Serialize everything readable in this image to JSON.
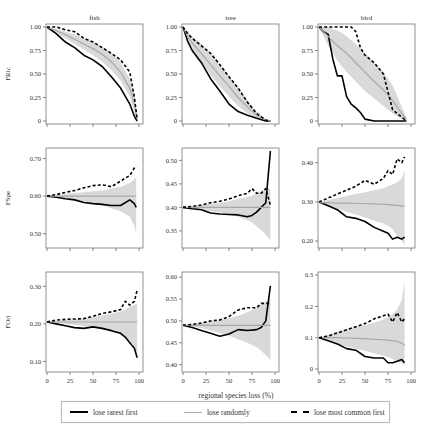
{
  "chart_data": [
    {
      "type": "line",
      "panel": "fish-FRic",
      "column_title": "fish",
      "ylabel": "FRic",
      "xlim": [
        0,
        100
      ],
      "ylim": [
        0,
        1.0
      ],
      "yticks": [
        0,
        0.25,
        0.5,
        0.75,
        1.0
      ],
      "ytick_labels": [
        "0",
        "0.25",
        "0.50",
        "0.75",
        "1.00"
      ],
      "x": [
        0,
        10,
        20,
        30,
        40,
        50,
        60,
        70,
        80,
        90,
        95,
        98
      ],
      "series": [
        {
          "name": "lose rarest first",
          "values": [
            1.0,
            0.93,
            0.84,
            0.78,
            0.7,
            0.65,
            0.58,
            0.47,
            0.35,
            0.18,
            0.05,
            0.0
          ]
        },
        {
          "name": "lose randomly",
          "values": [
            1.0,
            0.96,
            0.92,
            0.87,
            0.82,
            0.77,
            0.71,
            0.63,
            0.52,
            0.35,
            0.18,
            0.02
          ]
        },
        {
          "name": "lose most common first",
          "values": [
            1.0,
            1.0,
            0.97,
            0.95,
            0.88,
            0.84,
            0.78,
            0.72,
            0.65,
            0.52,
            0.25,
            0.02
          ]
        }
      ],
      "band_upper": [
        1.0,
        0.98,
        0.95,
        0.92,
        0.88,
        0.84,
        0.79,
        0.72,
        0.62,
        0.45,
        0.28,
        0.04
      ],
      "band_lower": [
        1.0,
        0.94,
        0.88,
        0.82,
        0.76,
        0.7,
        0.63,
        0.54,
        0.43,
        0.26,
        0.1,
        0.0
      ]
    },
    {
      "type": "line",
      "panel": "tree-FRic",
      "column_title": "tree",
      "ylabel": "",
      "xlim": [
        0,
        100
      ],
      "ylim": [
        0,
        1.0
      ],
      "yticks": [
        0,
        0.25,
        0.5,
        0.75,
        1.0
      ],
      "ytick_labels": [
        "0",
        "0.25",
        "0.50",
        "0.75",
        "1.00"
      ],
      "x": [
        0,
        5,
        10,
        20,
        30,
        40,
        50,
        60,
        70,
        80,
        90,
        95
      ],
      "series": [
        {
          "name": "lose rarest first",
          "values": [
            1.0,
            0.85,
            0.75,
            0.62,
            0.45,
            0.32,
            0.18,
            0.1,
            0.06,
            0.03,
            0.0,
            0.0
          ]
        },
        {
          "name": "lose randomly",
          "values": [
            1.0,
            0.9,
            0.83,
            0.72,
            0.6,
            0.48,
            0.37,
            0.25,
            0.15,
            0.06,
            0.01,
            0.0
          ]
        },
        {
          "name": "lose most common first",
          "values": [
            1.0,
            0.93,
            0.88,
            0.8,
            0.72,
            0.6,
            0.47,
            0.35,
            0.2,
            0.08,
            0.01,
            0.0
          ]
        }
      ],
      "band_upper": [
        1.0,
        0.95,
        0.9,
        0.82,
        0.72,
        0.6,
        0.48,
        0.35,
        0.22,
        0.1,
        0.02,
        0.0
      ],
      "band_lower": [
        1.0,
        0.85,
        0.76,
        0.63,
        0.49,
        0.37,
        0.26,
        0.16,
        0.08,
        0.02,
        0.0,
        0.0
      ]
    },
    {
      "type": "line",
      "panel": "bird-FRic",
      "column_title": "bird",
      "ylabel": "",
      "xlim": [
        0,
        100
      ],
      "ylim": [
        0,
        1.0
      ],
      "yticks": [
        0,
        0.25,
        0.5,
        0.75,
        1.0
      ],
      "ytick_labels": [
        "0",
        "0.25",
        "0.50",
        "0.75",
        "1.00"
      ],
      "x": [
        0,
        5,
        10,
        15,
        20,
        25,
        30,
        35,
        40,
        45,
        50,
        60,
        70,
        80,
        90,
        95
      ],
      "series": [
        {
          "name": "lose rarest first",
          "values": [
            1.0,
            0.95,
            0.92,
            0.66,
            0.48,
            0.48,
            0.26,
            0.18,
            0.14,
            0.09,
            0.02,
            0.0,
            0.0,
            0.0,
            0.0,
            0.0
          ]
        },
        {
          "name": "lose randomly",
          "values": [
            1.0,
            0.95,
            0.9,
            0.85,
            0.8,
            0.76,
            0.72,
            0.67,
            0.62,
            0.57,
            0.52,
            0.42,
            0.33,
            0.22,
            0.08,
            0.02
          ]
        },
        {
          "name": "lose most common first",
          "values": [
            1.0,
            1.0,
            1.0,
            1.0,
            1.0,
            1.0,
            1.0,
            1.0,
            0.95,
            0.78,
            0.7,
            0.62,
            0.5,
            0.12,
            0.04,
            0.0
          ]
        }
      ],
      "band_upper": [
        1.0,
        1.0,
        1.0,
        0.98,
        0.96,
        0.94,
        0.9,
        0.86,
        0.82,
        0.77,
        0.72,
        0.62,
        0.52,
        0.38,
        0.15,
        0.04
      ],
      "band_lower": [
        1.0,
        0.9,
        0.8,
        0.72,
        0.64,
        0.58,
        0.52,
        0.47,
        0.42,
        0.37,
        0.32,
        0.24,
        0.16,
        0.08,
        0.02,
        0.0
      ]
    },
    {
      "type": "line",
      "panel": "fish-FSpe",
      "ylabel": "FSpe",
      "xlim": [
        0,
        100
      ],
      "ylim": [
        0.47,
        0.72
      ],
      "yticks": [
        0.5,
        0.6,
        0.7
      ],
      "ytick_labels": [
        "0.50",
        "0.60",
        "0.70"
      ],
      "x": [
        0,
        10,
        20,
        30,
        40,
        50,
        60,
        70,
        80,
        90,
        95,
        97
      ],
      "series": [
        {
          "name": "lose rarest first",
          "values": [
            0.6,
            0.597,
            0.593,
            0.59,
            0.583,
            0.58,
            0.578,
            0.575,
            0.575,
            0.59,
            0.58,
            0.57
          ]
        },
        {
          "name": "lose randomly",
          "values": [
            0.6,
            0.6,
            0.6,
            0.6,
            0.6,
            0.6,
            0.6,
            0.6,
            0.6,
            0.6,
            0.6,
            0.6
          ]
        },
        {
          "name": "lose most common first",
          "values": [
            0.6,
            0.604,
            0.61,
            0.615,
            0.622,
            0.628,
            0.63,
            0.625,
            0.64,
            0.655,
            0.675,
            0.68
          ]
        }
      ],
      "band_upper": [
        0.6,
        0.602,
        0.605,
        0.608,
        0.61,
        0.613,
        0.615,
        0.62,
        0.625,
        0.635,
        0.645,
        0.65
      ],
      "band_lower": [
        0.6,
        0.598,
        0.595,
        0.59,
        0.586,
        0.58,
        0.575,
        0.568,
        0.56,
        0.545,
        0.52,
        0.5
      ]
    },
    {
      "type": "line",
      "panel": "tree-FSpe",
      "ylabel": "",
      "xlim": [
        0,
        100
      ],
      "ylim": [
        0.32,
        0.52
      ],
      "yticks": [
        0.35,
        0.4,
        0.45,
        0.5
      ],
      "ytick_labels": [
        "0.35",
        "0.40",
        "0.45",
        "0.50"
      ],
      "x": [
        0,
        10,
        20,
        30,
        40,
        50,
        60,
        70,
        75,
        80,
        85,
        90,
        95
      ],
      "series": [
        {
          "name": "lose rarest first",
          "values": [
            0.4,
            0.397,
            0.395,
            0.388,
            0.386,
            0.385,
            0.384,
            0.38,
            0.383,
            0.39,
            0.4,
            0.41,
            0.52
          ]
        },
        {
          "name": "lose randomly",
          "values": [
            0.4,
            0.4,
            0.4,
            0.4,
            0.4,
            0.4,
            0.4,
            0.4,
            0.4,
            0.4,
            0.4,
            0.4,
            0.4
          ]
        },
        {
          "name": "lose most common first",
          "values": [
            0.4,
            0.402,
            0.405,
            0.41,
            0.413,
            0.418,
            0.425,
            0.43,
            0.44,
            0.43,
            0.43,
            0.44,
            0.405
          ]
        }
      ],
      "band_upper": [
        0.4,
        0.402,
        0.405,
        0.408,
        0.41,
        0.413,
        0.418,
        0.422,
        0.425,
        0.43,
        0.435,
        0.44,
        0.44
      ],
      "band_lower": [
        0.4,
        0.398,
        0.395,
        0.392,
        0.389,
        0.385,
        0.38,
        0.373,
        0.368,
        0.36,
        0.352,
        0.342,
        0.33
      ]
    },
    {
      "type": "line",
      "panel": "bird-FSpe",
      "ylabel": "",
      "xlim": [
        0,
        100
      ],
      "ylim": [
        0.19,
        0.43
      ],
      "yticks": [
        0.2,
        0.3,
        0.4
      ],
      "ytick_labels": [
        "0.20",
        "0.30",
        "0.40"
      ],
      "x": [
        0,
        10,
        20,
        30,
        40,
        50,
        60,
        70,
        75,
        80,
        85,
        90,
        93
      ],
      "series": [
        {
          "name": "lose rarest first",
          "values": [
            0.3,
            0.29,
            0.28,
            0.262,
            0.258,
            0.25,
            0.235,
            0.225,
            0.22,
            0.205,
            0.21,
            0.205,
            0.21
          ]
        },
        {
          "name": "lose randomly",
          "values": [
            0.298,
            0.298,
            0.297,
            0.297,
            0.296,
            0.296,
            0.295,
            0.294,
            0.293,
            0.292,
            0.291,
            0.29,
            0.29
          ]
        },
        {
          "name": "lose most common first",
          "values": [
            0.3,
            0.31,
            0.32,
            0.33,
            0.34,
            0.355,
            0.345,
            0.36,
            0.38,
            0.37,
            0.41,
            0.4,
            0.415
          ]
        }
      ],
      "band_upper": [
        0.3,
        0.305,
        0.31,
        0.315,
        0.32,
        0.325,
        0.33,
        0.335,
        0.34,
        0.345,
        0.35,
        0.36,
        0.38
      ],
      "band_lower": [
        0.3,
        0.29,
        0.283,
        0.275,
        0.268,
        0.26,
        0.252,
        0.245,
        0.24,
        0.23,
        0.215,
        0.2,
        0.19
      ]
    },
    {
      "type": "line",
      "panel": "fish-FOri",
      "ylabel": "FOri",
      "xlim": [
        0,
        100
      ],
      "ylim": [
        0.08,
        0.33
      ],
      "yticks": [
        0.1,
        0.2,
        0.3
      ],
      "ytick_labels": [
        "0.10",
        "0.20",
        "0.30"
      ],
      "xticks": [
        0,
        25,
        50,
        75,
        100
      ],
      "xtick_labels": [
        "0",
        "25",
        "50",
        "75",
        "100"
      ],
      "x": [
        0,
        10,
        20,
        30,
        40,
        50,
        60,
        70,
        80,
        85,
        90,
        95,
        98
      ],
      "series": [
        {
          "name": "lose rarest first",
          "values": [
            0.205,
            0.2,
            0.195,
            0.19,
            0.188,
            0.192,
            0.188,
            0.182,
            0.175,
            0.165,
            0.15,
            0.135,
            0.11
          ]
        },
        {
          "name": "lose randomly",
          "values": [
            0.205,
            0.205,
            0.205,
            0.205,
            0.205,
            0.205,
            0.205,
            0.205,
            0.205,
            0.205,
            0.205,
            0.205,
            0.205
          ]
        },
        {
          "name": "lose most common first",
          "values": [
            0.205,
            0.21,
            0.212,
            0.213,
            0.214,
            0.22,
            0.228,
            0.232,
            0.238,
            0.26,
            0.25,
            0.26,
            0.29
          ]
        }
      ],
      "band_upper": [
        0.205,
        0.207,
        0.21,
        0.212,
        0.215,
        0.218,
        0.222,
        0.227,
        0.233,
        0.238,
        0.245,
        0.25,
        0.255
      ],
      "band_lower": [
        0.205,
        0.203,
        0.2,
        0.197,
        0.194,
        0.19,
        0.186,
        0.18,
        0.172,
        0.165,
        0.155,
        0.14,
        0.12
      ]
    },
    {
      "type": "line",
      "panel": "tree-FOri",
      "ylabel": "",
      "xlim": [
        0,
        100
      ],
      "ylim": [
        0.39,
        0.605
      ],
      "yticks": [
        0.4,
        0.45,
        0.5,
        0.55,
        0.6
      ],
      "ytick_labels": [
        "0.40",
        "0.45",
        "0.50",
        "0.55",
        "0.60"
      ],
      "xticks": [
        0,
        25,
        50,
        75,
        100
      ],
      "xtick_labels": [
        "0",
        "25",
        "50",
        "75",
        "100"
      ],
      "xlabel": "regional species loss (%)",
      "x": [
        0,
        10,
        20,
        30,
        40,
        50,
        60,
        70,
        80,
        85,
        90,
        95
      ],
      "series": [
        {
          "name": "lose rarest first",
          "values": [
            0.49,
            0.485,
            0.478,
            0.472,
            0.465,
            0.47,
            0.48,
            0.478,
            0.48,
            0.485,
            0.5,
            0.58
          ]
        },
        {
          "name": "lose randomly",
          "values": [
            0.49,
            0.49,
            0.49,
            0.49,
            0.49,
            0.49,
            0.49,
            0.49,
            0.49,
            0.49,
            0.49,
            0.49
          ]
        },
        {
          "name": "lose most common first",
          "values": [
            0.49,
            0.492,
            0.495,
            0.5,
            0.502,
            0.51,
            0.525,
            0.53,
            0.53,
            0.54,
            0.54,
            0.54
          ]
        }
      ],
      "band_upper": [
        0.49,
        0.492,
        0.495,
        0.498,
        0.502,
        0.506,
        0.512,
        0.52,
        0.53,
        0.538,
        0.545,
        0.55
      ],
      "band_lower": [
        0.49,
        0.487,
        0.483,
        0.478,
        0.472,
        0.466,
        0.458,
        0.45,
        0.44,
        0.432,
        0.422,
        0.41
      ]
    },
    {
      "type": "line",
      "panel": "bird-FOri",
      "ylabel": "",
      "xlim": [
        0,
        100
      ],
      "ylim": [
        0,
        0.3
      ],
      "yticks": [
        0,
        0.1,
        0.2,
        0.3
      ],
      "ytick_labels": [
        "0",
        "0.1",
        "0.2",
        "0.3"
      ],
      "xticks": [
        0,
        25,
        50,
        75,
        100
      ],
      "xtick_labels": [
        "0",
        "25",
        "50",
        "75",
        "100"
      ],
      "x": [
        0,
        10,
        20,
        30,
        40,
        50,
        60,
        70,
        75,
        80,
        85,
        90,
        93
      ],
      "series": [
        {
          "name": "lose rarest first",
          "values": [
            0.1,
            0.09,
            0.08,
            0.065,
            0.06,
            0.04,
            0.035,
            0.035,
            0.02,
            0.02,
            0.025,
            0.03,
            0.02
          ]
        },
        {
          "name": "lose randomly",
          "values": [
            0.1,
            0.1,
            0.1,
            0.099,
            0.098,
            0.097,
            0.095,
            0.093,
            0.092,
            0.09,
            0.088,
            0.082,
            0.075
          ]
        },
        {
          "name": "lose most common first",
          "values": [
            0.1,
            0.105,
            0.115,
            0.125,
            0.135,
            0.145,
            0.16,
            0.17,
            0.175,
            0.15,
            0.18,
            0.15,
            0.16
          ]
        }
      ],
      "band_upper": [
        0.1,
        0.11,
        0.12,
        0.128,
        0.135,
        0.14,
        0.148,
        0.158,
        0.165,
        0.175,
        0.19,
        0.22,
        0.28
      ],
      "band_lower": [
        0.1,
        0.09,
        0.08,
        0.072,
        0.065,
        0.058,
        0.05,
        0.042,
        0.038,
        0.032,
        0.025,
        0.018,
        0.01
      ]
    }
  ],
  "figure": {
    "column_titles": [
      "fish",
      "tree",
      "bird"
    ],
    "row_ylabels": [
      "FRic",
      "FSpe",
      "FOri"
    ],
    "xlabel": "regional species loss (%)",
    "legend": {
      "rare": "lose rarest first",
      "random": "lose randomly",
      "common": "lose most common first"
    }
  },
  "colors": {
    "rare": "#000000",
    "random": "#a8a8a8",
    "common": "#000000",
    "band": "#d9d9d9",
    "axis": "#555555",
    "text": "#333333"
  }
}
